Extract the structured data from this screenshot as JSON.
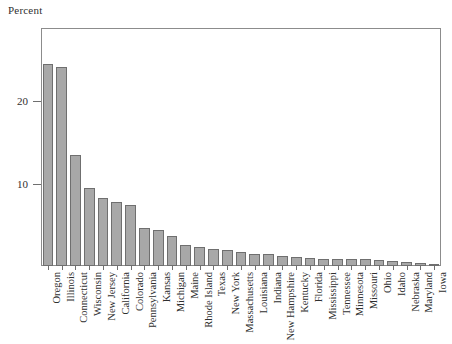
{
  "chart_data": {
    "type": "bar",
    "title": "",
    "subtitle": "",
    "ylabel": "Percent",
    "xlabel": "",
    "grid": false,
    "legend": false,
    "ylim": [
      0,
      28.9
    ],
    "yticks": [
      10,
      20
    ],
    "ytick_labels": [
      "10",
      "20"
    ],
    "categories": [
      "Oregon",
      "Illinois",
      "Connecticut",
      "Wisconsin",
      "New Jersey",
      "California",
      "Colorado",
      "Pennsylvania",
      "Kansas",
      "Michigan",
      "Maine",
      "Rhode Island",
      "Texas",
      "New York",
      "Massachusetts",
      "Louisiana",
      "Indiana",
      "New Hampshire",
      "Kentucky",
      "Florida",
      "Mississippi",
      "Tennessee",
      "Minnesota",
      "Missouri",
      "Ohio",
      "Idaho",
      "Nebraska",
      "Maryland",
      "Iowa"
    ],
    "values": [
      24.5,
      24.2,
      13.5,
      9.5,
      8.3,
      7.8,
      7.4,
      4.6,
      4.4,
      3.6,
      2.6,
      2.3,
      2.1,
      1.9,
      1.7,
      1.5,
      1.4,
      1.2,
      1.1,
      1.0,
      0.9,
      0.9,
      0.8,
      0.8,
      0.7,
      0.6,
      0.5,
      0.4,
      0.3
    ],
    "bar_color": "#a8a8a8",
    "bar_edge_color": "#6f6f6f",
    "axis_color": "#8c8c8c"
  },
  "axis": {
    "y_label": "Percent"
  }
}
